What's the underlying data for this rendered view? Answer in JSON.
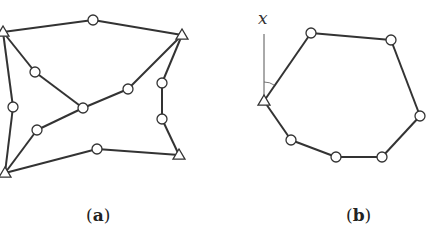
{
  "diagram_a": {
    "caption_open": "(",
    "caption_letter": "a",
    "caption_close": ")",
    "supports": [
      {
        "id": "A1",
        "x": 3,
        "y": 32
      },
      {
        "id": "A2",
        "x": 182,
        "y": 35
      },
      {
        "id": "A3",
        "x": 179,
        "y": 155
      },
      {
        "id": "A4",
        "x": 5,
        "y": 173
      }
    ],
    "joints": [
      {
        "id": "J1",
        "x": 93,
        "y": 20
      },
      {
        "id": "J2",
        "x": 35,
        "y": 72
      },
      {
        "id": "J3",
        "x": 13,
        "y": 107
      },
      {
        "id": "J4",
        "x": 83,
        "y": 108
      },
      {
        "id": "J5",
        "x": 128,
        "y": 89
      },
      {
        "id": "J6",
        "x": 37,
        "y": 130
      },
      {
        "id": "J7",
        "x": 162,
        "y": 83
      },
      {
        "id": "J8",
        "x": 162,
        "y": 119
      },
      {
        "id": "J9",
        "x": 97,
        "y": 149
      }
    ],
    "edges": [
      [
        "A1",
        "J1"
      ],
      [
        "J1",
        "A2"
      ],
      [
        "A1",
        "J2"
      ],
      [
        "J2",
        "J4"
      ],
      [
        "A1",
        "J3"
      ],
      [
        "J3",
        "A4"
      ],
      [
        "A4",
        "J6"
      ],
      [
        "J6",
        "J4"
      ],
      [
        "J4",
        "J5"
      ],
      [
        "J5",
        "A2"
      ],
      [
        "A2",
        "J7"
      ],
      [
        "J7",
        "J8"
      ],
      [
        "J8",
        "A3"
      ],
      [
        "A4",
        "J9"
      ],
      [
        "J9",
        "A3"
      ]
    ]
  },
  "diagram_b": {
    "caption_open": "(",
    "caption_letter": "b",
    "caption_close": ")",
    "axis_label": "x",
    "axis": {
      "x": 264,
      "y_top": 34,
      "y_bottom": 100
    },
    "supports": [
      {
        "id": "B0",
        "x": 264,
        "y": 101
      }
    ],
    "joints": [
      {
        "id": "B1",
        "x": 311,
        "y": 33
      },
      {
        "id": "B2",
        "x": 391,
        "y": 40
      },
      {
        "id": "B3",
        "x": 420,
        "y": 116
      },
      {
        "id": "B4",
        "x": 382,
        "y": 157
      },
      {
        "id": "B5",
        "x": 336,
        "y": 157
      },
      {
        "id": "B6",
        "x": 291,
        "y": 140
      }
    ],
    "edges": [
      [
        "B0",
        "B1"
      ],
      [
        "B1",
        "B2"
      ],
      [
        "B2",
        "B3"
      ],
      [
        "B3",
        "B4"
      ],
      [
        "B4",
        "B5"
      ],
      [
        "B5",
        "B6"
      ],
      [
        "B6",
        "B0"
      ]
    ]
  },
  "colors": {
    "line": "#333333",
    "background": "#ffffff"
  }
}
